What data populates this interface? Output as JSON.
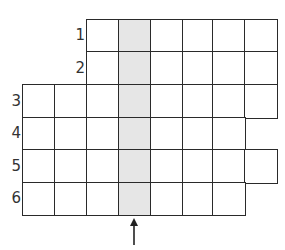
{
  "diagram": {
    "type": "grid-puzzle",
    "cell_size": 32.5,
    "origin": {
      "x": 23,
      "y": 20
    },
    "highlight_color": "#e6e6e6",
    "highlight_column": 3,
    "rows": [
      {
        "label": "1",
        "start_col": 2,
        "end_col": 7,
        "top": 20
      },
      {
        "label": "2",
        "start_col": 2,
        "end_col": 7,
        "top": 52
      },
      {
        "label": "3",
        "start_col": 0,
        "end_col": 7,
        "top": 85
      },
      {
        "label": "4",
        "start_col": 0,
        "end_col": 6,
        "top": 118
      },
      {
        "label": "5",
        "start_col": 0,
        "end_col": 7,
        "top": 150
      },
      {
        "label": "6",
        "start_col": 0,
        "end_col": 6,
        "top": 183
      }
    ],
    "arrow": {
      "direction": "up",
      "icon": "arrow-up-icon",
      "column": 3
    }
  }
}
